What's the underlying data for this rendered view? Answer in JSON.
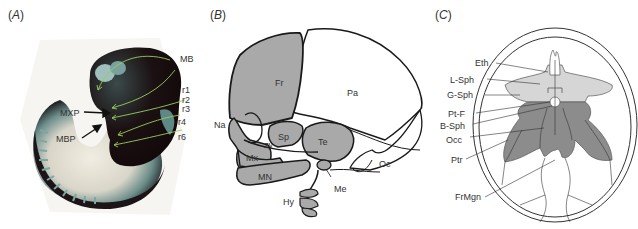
{
  "figure": {
    "panels": [
      {
        "id": "A",
        "label": "(A)",
        "label_letter": "A",
        "description": "Embryo photograph with labeled green arrows",
        "labels": [
          "MB",
          "r1",
          "r2",
          "r3",
          "r4",
          "r6",
          "MXP",
          "MBP"
        ]
      },
      {
        "id": "B",
        "label": "(B)",
        "label_letter": "B",
        "description": "Lateral view of skull bones",
        "labels": [
          "Fr",
          "Pa",
          "Na",
          "Sp",
          "zy",
          "Te",
          "Mx",
          "MN",
          "Oc",
          "Me",
          "Hy"
        ]
      },
      {
        "id": "C",
        "label": "(C)",
        "label_letter": "C",
        "description": "Superior view of cranial base",
        "labels": [
          "Eth",
          "L-Sph",
          "G-Sph",
          "Pt-F",
          "B-Sph",
          "Occ",
          "Ptr",
          "FrMgn"
        ]
      }
    ],
    "colors": {
      "bone_fill_light": "#d9d9d9",
      "bone_fill_mid": "#a9a9a9",
      "bone_fill_dark": "#8c8c8c",
      "outline": "#1a1a1a",
      "arrow_green": "#9acd5a",
      "embryo_dark": "#1a0d0f",
      "embryo_teal": "#5f8f8c"
    }
  }
}
